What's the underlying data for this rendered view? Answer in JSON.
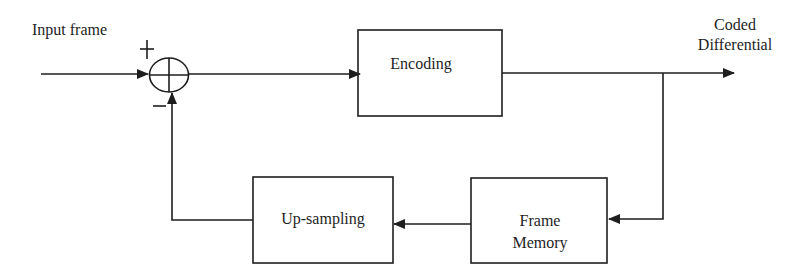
{
  "diagram": {
    "title": "",
    "type": "block-diagram",
    "colors": {
      "line": "#1e1e1e",
      "background": "#ffffff"
    },
    "labels": {
      "input": "Input frame",
      "plus_sign": "+",
      "minus_sign": "−",
      "output_line1": "Coded",
      "output_line2": "Differential"
    },
    "blocks": [
      {
        "id": "encoding",
        "label": "Encoding"
      },
      {
        "id": "frame_memory",
        "label_line1": "Frame",
        "label_line2": "Memory"
      },
      {
        "id": "upsampling",
        "label": "Up-sampling"
      }
    ],
    "nodes": [
      {
        "id": "summer",
        "symbol": "circle-plus"
      }
    ],
    "edges": [
      {
        "from": "input",
        "to": "summer",
        "sign": "+"
      },
      {
        "from": "summer",
        "to": "encoding"
      },
      {
        "from": "encoding",
        "to": "output"
      },
      {
        "from": "encoding-output",
        "to": "frame_memory"
      },
      {
        "from": "frame_memory",
        "to": "upsampling"
      },
      {
        "from": "upsampling",
        "to": "summer",
        "sign": "−"
      }
    ]
  }
}
